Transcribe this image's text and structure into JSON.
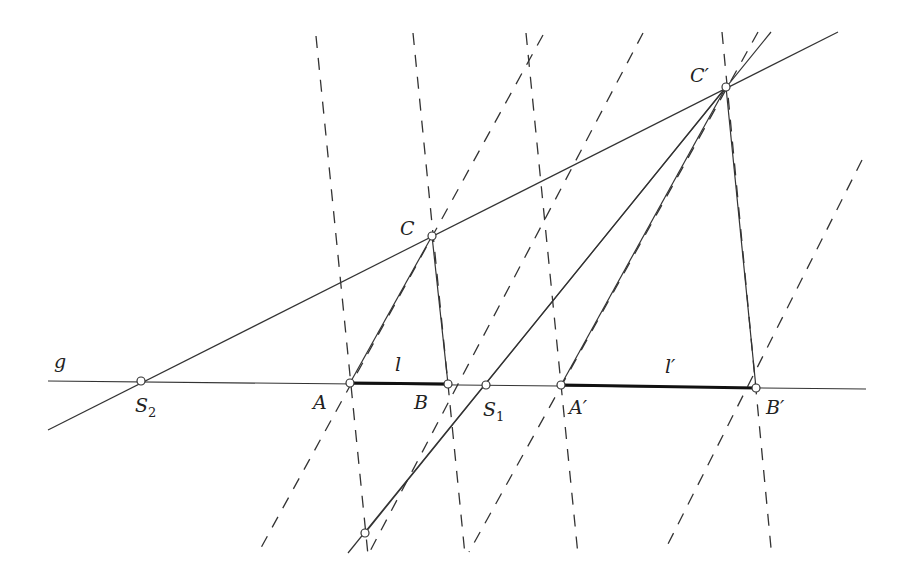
{
  "diagram": {
    "title": "",
    "colors": {
      "line": "#333333",
      "point_fill": "#ffffff"
    },
    "labels": {
      "g": "g",
      "S2": "S",
      "S2_sub": "2",
      "A": "A",
      "B": "B",
      "S1": "S",
      "S1_sub": "1",
      "A_prime": "A′",
      "B_prime": "B′",
      "C": "C",
      "C_prime": "C′",
      "l": "l",
      "l_prime": "l′"
    },
    "points": {
      "S2": [
        141,
        381
      ],
      "A": [
        350,
        383
      ],
      "B": [
        448,
        384
      ],
      "S1": [
        486,
        385
      ],
      "A_prime": [
        561,
        385
      ],
      "B_prime": [
        756,
        388
      ],
      "C": [
        432,
        236
      ],
      "C_prime": [
        726,
        87
      ],
      "P": [
        365,
        533
      ]
    },
    "solid_lines": [
      {
        "name": "line-g",
        "from": [
          48,
          381
        ],
        "to": [
          866,
          389
        ]
      },
      {
        "name": "line-S2-C-Cprime",
        "from": [
          48,
          430
        ],
        "to": [
          838,
          32
        ]
      },
      {
        "name": "line-S1-Cprime",
        "from": [
          348,
          553
        ],
        "to": [
          771,
          32
        ]
      },
      {
        "name": "seg-A-C",
        "from": [
          350,
          383
        ],
        "to": [
          432,
          236
        ]
      },
      {
        "name": "seg-B-C",
        "from": [
          448,
          384
        ],
        "to": [
          432,
          236
        ]
      },
      {
        "name": "seg-Aprime-Cprime",
        "from": [
          561,
          385
        ],
        "to": [
          726,
          87
        ]
      },
      {
        "name": "seg-Bprime-Cprime",
        "from": [
          756,
          388
        ],
        "to": [
          726,
          87
        ]
      },
      {
        "name": "seg-P-Cprime",
        "from": [
          365,
          533
        ],
        "to": [
          726,
          87
        ]
      }
    ],
    "thick_segments": [
      {
        "name": "segment-l",
        "from": [
          350,
          383
        ],
        "to": [
          448,
          384
        ]
      },
      {
        "name": "segment-l-prime",
        "from": [
          561,
          385
        ],
        "to": [
          756,
          388
        ]
      }
    ],
    "dashed_lines": [
      {
        "name": "dash-1",
        "from": [
          316,
          36
        ],
        "to": [
          368,
          555
        ]
      },
      {
        "name": "dash-2",
        "from": [
          413,
          33
        ],
        "to": [
          465,
          555
        ]
      },
      {
        "name": "dash-3",
        "from": [
          526,
          33
        ],
        "to": [
          578,
          555
        ]
      },
      {
        "name": "dash-4",
        "from": [
          722,
          32
        ],
        "to": [
          771,
          548
        ]
      },
      {
        "name": "dash-5",
        "from": [
          543,
          35
        ],
        "to": [
          257,
          555
        ]
      },
      {
        "name": "dash-6",
        "from": [
          643,
          33
        ],
        "to": [
          368,
          555
        ]
      },
      {
        "name": "dash-7",
        "from": [
          758,
          32
        ],
        "to": [
          469,
          552
        ]
      },
      {
        "name": "dash-8",
        "from": [
          862,
          160
        ],
        "to": [
          664,
          552
        ]
      }
    ]
  }
}
